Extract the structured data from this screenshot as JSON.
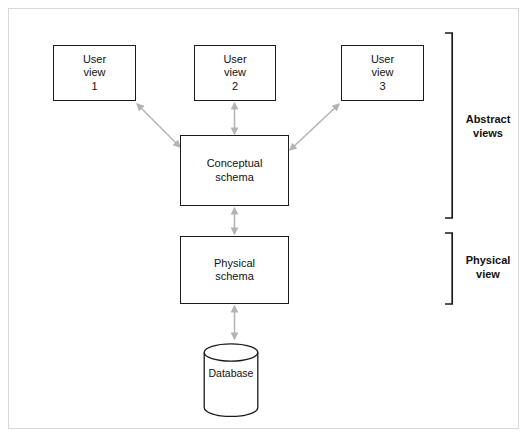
{
  "diagram": {
    "background_color": "#ffffff",
    "frame_color": "#d8d8d8",
    "node_border_color": "#1b1b1b",
    "arrow_color": "#b3b3b3",
    "text_color": "#111111",
    "nodes": {
      "user_view_1": {
        "line1": "User",
        "line2": "view",
        "line3": "1"
      },
      "user_view_2": {
        "line1": "User",
        "line2": "view",
        "line3": "2"
      },
      "user_view_3": {
        "line1": "User",
        "line2": "view",
        "line3": "3"
      },
      "conceptual_schema": {
        "line1": "Conceptual",
        "line2": "schema"
      },
      "physical_schema": {
        "line1": "Physical",
        "line2": "schema"
      },
      "database": {
        "label": "Database"
      }
    },
    "groups": {
      "abstract": {
        "line1": "Abstract",
        "line2": "views"
      },
      "physical": {
        "line1": "Physical",
        "line2": "view"
      }
    },
    "connectors": [
      {
        "name": "user-view-1-to-conceptual",
        "style": "double-headed",
        "kind": "diagonal"
      },
      {
        "name": "user-view-2-to-conceptual",
        "style": "double-headed",
        "kind": "vertical"
      },
      {
        "name": "user-view-3-to-conceptual",
        "style": "double-headed",
        "kind": "diagonal"
      },
      {
        "name": "conceptual-to-physical",
        "style": "double-headed",
        "kind": "vertical"
      },
      {
        "name": "physical-to-database",
        "style": "double-headed",
        "kind": "vertical"
      }
    ]
  }
}
